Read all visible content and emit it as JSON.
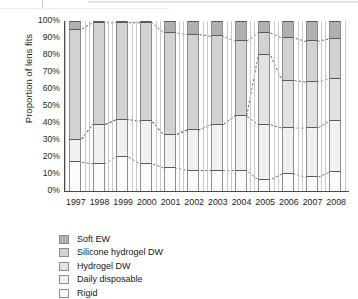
{
  "chart_data": {
    "type": "area",
    "title": "",
    "xlabel": "",
    "ylabel": "Proportion of lens fits",
    "ylim": [
      0,
      100
    ],
    "ytick_labels": [
      "100%",
      "90%",
      "80%",
      "70%",
      "60%",
      "50%",
      "40%",
      "30%",
      "20%",
      "10%",
      "0%"
    ],
    "ytick_values": [
      100,
      90,
      80,
      70,
      60,
      50,
      40,
      30,
      20,
      10,
      0
    ],
    "categories": [
      "1997",
      "1998",
      "1999",
      "2000",
      "2001",
      "2002",
      "2003",
      "2004",
      "2005",
      "2006",
      "2007",
      "2008"
    ],
    "grid": false,
    "legend_position": "below",
    "stacking": "percent",
    "series": [
      {
        "name": "Soft EW",
        "color": "#b0b0b0",
        "values": [
          5,
          1,
          1,
          1,
          7,
          8,
          9,
          12,
          7,
          10,
          12,
          10.5
        ],
        "cumulative_upper": [
          100,
          100,
          100,
          100,
          100,
          100,
          100,
          100,
          100,
          100,
          100,
          100
        ],
        "cumulative_lower": [
          95,
          99,
          99,
          99,
          93,
          92,
          91,
          88,
          93,
          90,
          88,
          89.5
        ]
      },
      {
        "name": "Silicone hydrogel DW",
        "color": "#d2d2d2",
        "values": [
          65,
          60,
          57,
          58,
          60,
          56,
          52,
          44,
          13,
          25,
          24,
          23.5
        ],
        "cumulative_lower": [
          30,
          39,
          42,
          41,
          33,
          36,
          39,
          44,
          80,
          65,
          64,
          66
        ]
      },
      {
        "name": "Hydrogel DW",
        "color": "#e2e2e2",
        "values": [
          0,
          0,
          0,
          0,
          0,
          0,
          0,
          0,
          41,
          28,
          27,
          25
        ],
        "cumulative_lower": [
          30,
          39,
          42,
          41,
          33,
          36,
          39,
          44,
          39,
          37,
          37,
          41
        ]
      },
      {
        "name": "Daily disposable",
        "color": "#f0f0f0",
        "values": [
          13,
          23,
          22,
          25,
          19.5,
          24,
          27,
          32,
          32.5,
          27,
          29,
          30
        ],
        "cumulative_lower": [
          17,
          16,
          20,
          16,
          13.5,
          12,
          12,
          12,
          6.5,
          10,
          8,
          11
        ]
      },
      {
        "name": "Rigid",
        "color": "#fbfbfb",
        "values": [
          17,
          16,
          20,
          16,
          13.5,
          12,
          12,
          12,
          6.5,
          10,
          8,
          11
        ],
        "cumulative_lower": [
          0,
          0,
          0,
          0,
          0,
          0,
          0,
          0,
          0,
          0,
          0,
          0
        ]
      }
    ]
  },
  "legend": {
    "items": [
      {
        "label": "Soft EW",
        "color": "#b0b0b0"
      },
      {
        "label": "Silicone hydrogel DW",
        "color": "#d2d2d2"
      },
      {
        "label": "Hydrogel DW",
        "color": "#e2e2e2"
      },
      {
        "label": "Daily disposable",
        "color": "#f0f0f0"
      },
      {
        "label": "Rigid",
        "color": "#fbfbfb"
      }
    ]
  }
}
